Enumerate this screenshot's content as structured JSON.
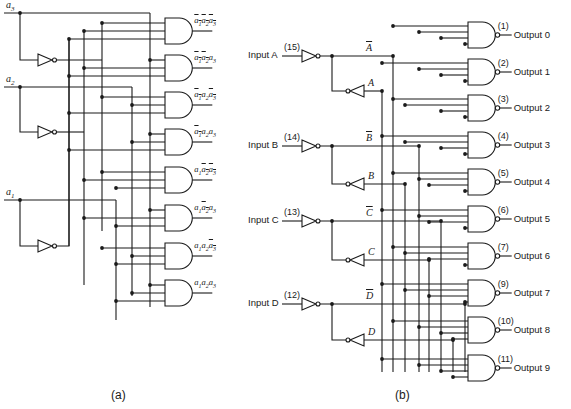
{
  "panel_a": {
    "caption": "(a)",
    "inputs": [
      {
        "name": "a3",
        "base": "a",
        "sub": "3"
      },
      {
        "name": "a2",
        "base": "a",
        "sub": "2"
      },
      {
        "name": "a1",
        "base": "a",
        "sub": "1"
      }
    ],
    "outputs": [
      {
        "terms": [
          [
            "a",
            "1",
            true
          ],
          [
            "a",
            "2",
            true
          ],
          [
            "a",
            "3",
            true
          ]
        ]
      },
      {
        "terms": [
          [
            "a",
            "1",
            true
          ],
          [
            "a",
            "2",
            true
          ],
          [
            "a",
            "3",
            false
          ]
        ]
      },
      {
        "terms": [
          [
            "a",
            "1",
            true
          ],
          [
            "a",
            "2",
            false
          ],
          [
            "a",
            "3",
            true
          ]
        ]
      },
      {
        "terms": [
          [
            "a",
            "1",
            true
          ],
          [
            "a",
            "2",
            false
          ],
          [
            "a",
            "3",
            false
          ]
        ]
      },
      {
        "terms": [
          [
            "a",
            "1",
            false
          ],
          [
            "a",
            "2",
            true
          ],
          [
            "a",
            "3",
            true
          ]
        ]
      },
      {
        "terms": [
          [
            "a",
            "1",
            false
          ],
          [
            "a",
            "2",
            true
          ],
          [
            "a",
            "3",
            false
          ]
        ]
      },
      {
        "terms": [
          [
            "a",
            "1",
            false
          ],
          [
            "a",
            "2",
            false
          ],
          [
            "a",
            "3",
            true
          ]
        ]
      },
      {
        "terms": [
          [
            "a",
            "1",
            false
          ],
          [
            "a",
            "2",
            false
          ],
          [
            "a",
            "3",
            false
          ]
        ]
      }
    ]
  },
  "panel_b": {
    "caption": "(b)",
    "inputs": [
      {
        "label": "Input A",
        "pin": "(15)",
        "inv": "A",
        "true": "A"
      },
      {
        "label": "Input B",
        "pin": "(14)",
        "inv": "B",
        "true": "B"
      },
      {
        "label": "Input C",
        "pin": "(13)",
        "inv": "C",
        "true": "C"
      },
      {
        "label": "Input D",
        "pin": "(12)",
        "inv": "D",
        "true": "D"
      }
    ],
    "outputs": [
      {
        "label": "Output 0",
        "pin": "(1)"
      },
      {
        "label": "Output 1",
        "pin": "(2)"
      },
      {
        "label": "Output 2",
        "pin": "(3)"
      },
      {
        "label": "Output 3",
        "pin": "(4)"
      },
      {
        "label": "Output 4",
        "pin": "(5)"
      },
      {
        "label": "Output 5",
        "pin": "(6)"
      },
      {
        "label": "Output 6",
        "pin": "(7)"
      },
      {
        "label": "Output 7",
        "pin": "(9)"
      },
      {
        "label": "Output 8",
        "pin": "(10)"
      },
      {
        "label": "Output 9",
        "pin": "(11)"
      }
    ]
  }
}
